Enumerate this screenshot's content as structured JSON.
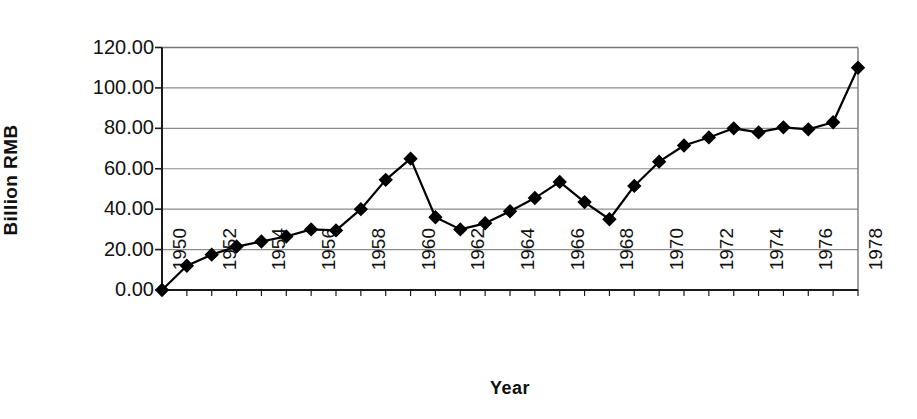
{
  "chart_data": {
    "type": "line",
    "title": "",
    "xlabel": "Year",
    "ylabel": "Billion RMB",
    "xlim": [
      1950,
      1978
    ],
    "ylim": [
      0,
      120
    ],
    "ytick_labels": [
      "120.00",
      "100.00",
      "80.00",
      "60.00",
      "40.00",
      "20.00",
      "0.00"
    ],
    "ytick_values": [
      120,
      100,
      80,
      60,
      40,
      20,
      0
    ],
    "xtick_labels": [
      "1950",
      "1952",
      "1954",
      "1956",
      "1958",
      "1960",
      "1962",
      "1964",
      "1966",
      "1968",
      "1970",
      "1972",
      "1974",
      "1976",
      "1978"
    ],
    "xtick_values": [
      1950,
      1952,
      1954,
      1956,
      1958,
      1960,
      1962,
      1964,
      1966,
      1968,
      1970,
      1972,
      1974,
      1976,
      1978
    ],
    "grid": "horizontal",
    "legend": "none",
    "marker": "diamond",
    "series": [
      {
        "name": "Billion RMB",
        "color": "#000000",
        "x": [
          1950,
          1951,
          1952,
          1953,
          1954,
          1955,
          1956,
          1957,
          1958,
          1959,
          1960,
          1961,
          1962,
          1963,
          1964,
          1965,
          1966,
          1967,
          1968,
          1969,
          1970,
          1971,
          1972,
          1973,
          1974,
          1975,
          1976,
          1977,
          1978
        ],
        "values": [
          0.0,
          12.0,
          17.5,
          21.5,
          24.0,
          26.5,
          30.0,
          29.5,
          40.0,
          54.5,
          65.0,
          36.0,
          30.0,
          33.0,
          39.0,
          45.5,
          53.5,
          43.5,
          35.0,
          51.5,
          63.5,
          71.5,
          75.5,
          80.0,
          78.0,
          80.5,
          79.5,
          83.0,
          110.0
        ]
      }
    ]
  },
  "axes": {
    "y_title": "Billion RMB",
    "x_title": "Year"
  }
}
